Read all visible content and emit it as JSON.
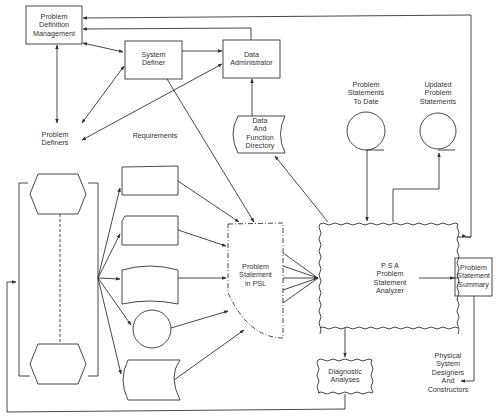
{
  "diagram": {
    "type": "data-flow",
    "colors": {
      "line": "#333333",
      "background": "#ffffff",
      "text": "#333333"
    },
    "nodes": {
      "pdm": {
        "label": "Problem\nDefinition\nManagement",
        "shape": "rectangle"
      },
      "sysdef": {
        "label": "System\nDefiner",
        "shape": "rectangle"
      },
      "dataadmin": {
        "label": "Data\nAdministrator",
        "shape": "rectangle"
      },
      "definers": {
        "label": "Problem\nDefiners",
        "shape": "text"
      },
      "requirements": {
        "label": "Requirements",
        "shape": "text"
      },
      "dfd": {
        "label": "Data\nAnd\nFunction\nDirectory",
        "shape": "stored-data"
      },
      "pstd": {
        "label": "Problem\nStatements\nTo Date",
        "shape": "magnetic-tape"
      },
      "ups": {
        "label": "Updated\nProblem\nStatements",
        "shape": "magnetic-tape"
      },
      "psl": {
        "label": "Problem\nStatement\nin PSL",
        "shape": "dash-dot-document"
      },
      "psa": {
        "label": "P S A\nProblem\nStatement\nAnalyzer",
        "shape": "wavy-box"
      },
      "pss": {
        "label": "Problem\nStatement\nSummary",
        "shape": "rectangle"
      },
      "diag": {
        "label": "Diagnostic\nAnalyses",
        "shape": "wavy-box"
      },
      "physical": {
        "label": "Physical\nSystem\nDesigners\nAnd\nConstructors",
        "shape": "text"
      },
      "hex_top": {
        "label": "",
        "shape": "hexagon"
      },
      "hex_bottom": {
        "label": "",
        "shape": "hexagon"
      },
      "input_manual": {
        "label": "",
        "shape": "manual-input"
      },
      "input_card": {
        "label": "",
        "shape": "punched-card"
      },
      "input_tape": {
        "label": "",
        "shape": "punched-tape"
      },
      "input_circle": {
        "label": "",
        "shape": "circle"
      },
      "input_stored": {
        "label": "",
        "shape": "stored-data"
      }
    },
    "edges": [
      {
        "from": "pdm",
        "to": "sysdef",
        "bidirectional": true
      },
      {
        "from": "pdm",
        "to": "definers",
        "bidirectional": true
      },
      {
        "from": "sysdef",
        "to": "dataadmin"
      },
      {
        "from": "sysdef",
        "to": "definers",
        "bidirectional": true
      },
      {
        "from": "definers",
        "to": "dataadmin",
        "bidirectional": true
      },
      {
        "from": "dataadmin",
        "to": "pdm"
      },
      {
        "from": "psa",
        "to": "pdm"
      },
      {
        "from": "dfd",
        "to": "dataadmin"
      },
      {
        "from": "psa",
        "to": "dfd"
      },
      {
        "from": "sysdef",
        "to": "psl"
      },
      {
        "from": "pstd",
        "to": "psa"
      },
      {
        "from": "psa",
        "to": "ups"
      },
      {
        "from": "input_manual",
        "to": "psl"
      },
      {
        "from": "input_card",
        "to": "psl"
      },
      {
        "from": "input_tape",
        "to": "psl"
      },
      {
        "from": "input_circle",
        "to": "psl"
      },
      {
        "from": "input_stored",
        "to": "psl"
      },
      {
        "from": "psl",
        "to": "psa",
        "count": 5
      },
      {
        "from": "psa",
        "to": "pss"
      },
      {
        "from": "pss",
        "to": "physical"
      },
      {
        "from": "psa",
        "to": "diag"
      },
      {
        "from": "diag",
        "to": "hex_group"
      }
    ]
  }
}
